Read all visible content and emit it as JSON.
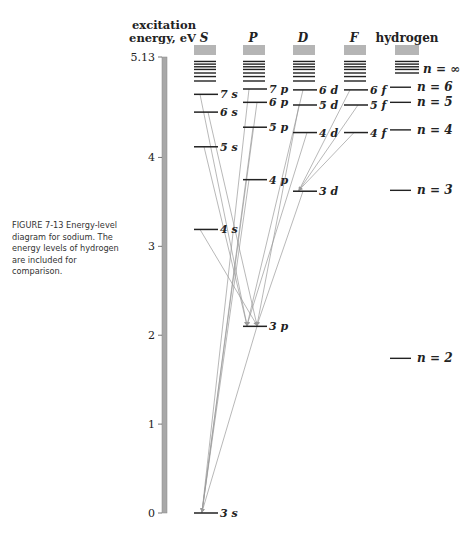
{
  "caption": "FIGURE 7-13  Energy-level diagram for sodium. The energy levels of hydrogen are included for comparison.",
  "axis": {
    "title_line1": "excitation",
    "title_line2": "energy, eV",
    "ticks": [
      {
        "label": "0",
        "value": 0
      },
      {
        "label": "1",
        "value": 1
      },
      {
        "label": "2",
        "value": 2
      },
      {
        "label": "3",
        "value": 3
      },
      {
        "label": "4",
        "value": 4
      },
      {
        "label": "5.13",
        "value": 5.13
      }
    ]
  },
  "columns": [
    {
      "key": "S",
      "label": "S",
      "x": 194,
      "levels": [
        {
          "label": "3s",
          "e": 0
        },
        {
          "label": "4s",
          "e": 3.19
        },
        {
          "label": "5s",
          "e": 4.12
        },
        {
          "label": "6s",
          "e": 4.51
        },
        {
          "label": "7s",
          "e": 4.71
        }
      ]
    },
    {
      "key": "P",
      "label": "P",
      "x": 243,
      "levels": [
        {
          "label": "3p",
          "e": 2.1
        },
        {
          "label": "4p",
          "e": 3.75
        },
        {
          "label": "5p",
          "e": 4.34
        },
        {
          "label": "6p",
          "e": 4.62
        },
        {
          "label": "7p",
          "e": 4.77
        }
      ]
    },
    {
      "key": "D",
      "label": "D",
      "x": 293,
      "levels": [
        {
          "label": "3d",
          "e": 3.62
        },
        {
          "label": "4d",
          "e": 4.28
        },
        {
          "label": "5d",
          "e": 4.59
        },
        {
          "label": "6d",
          "e": 4.76
        }
      ]
    },
    {
      "key": "F",
      "label": "F",
      "x": 344,
      "levels": [
        {
          "label": "4f",
          "e": 4.28
        },
        {
          "label": "5f",
          "e": 4.59
        },
        {
          "label": "6f",
          "e": 4.76
        }
      ]
    },
    {
      "key": "H",
      "label": "hydrogen",
      "x": 395,
      "levels": [
        {
          "label": "n = 2",
          "e": 1.74
        },
        {
          "label": "n = 3",
          "e": 3.63
        },
        {
          "label": "n = 4",
          "e": 4.31
        },
        {
          "label": "n = 5",
          "e": 4.62
        },
        {
          "label": "n = 6",
          "e": 4.79
        },
        {
          "label": "n = ∞",
          "e": 5.13
        }
      ]
    }
  ],
  "transitions": [
    {
      "from": "S:4s",
      "to": "P:3p"
    },
    {
      "from": "S:5s",
      "to": "P:3p"
    },
    {
      "from": "S:6s",
      "to": "P:3p"
    },
    {
      "from": "S:7s",
      "to": "P:3p"
    },
    {
      "from": "D:3d",
      "to": "P:3p"
    },
    {
      "from": "D:4d",
      "to": "P:3p"
    },
    {
      "from": "D:5d",
      "to": "P:3p"
    },
    {
      "from": "D:6d",
      "to": "P:3p"
    },
    {
      "from": "P:3p",
      "to": "S:3s"
    },
    {
      "from": "P:4p",
      "to": "S:3s"
    },
    {
      "from": "P:5p",
      "to": "S:3s"
    },
    {
      "from": "P:6p",
      "to": "S:3s"
    },
    {
      "from": "P:7p",
      "to": "S:3s"
    },
    {
      "from": "F:4f",
      "to": "D:3d"
    },
    {
      "from": "F:5f",
      "to": "D:3d"
    },
    {
      "from": "F:6f",
      "to": "D:3d"
    }
  ],
  "colors": {
    "level": "#222222",
    "transition": "#9a9a9a",
    "axisbar": "#a8a8a8",
    "continuum": "#b5b5b5"
  }
}
